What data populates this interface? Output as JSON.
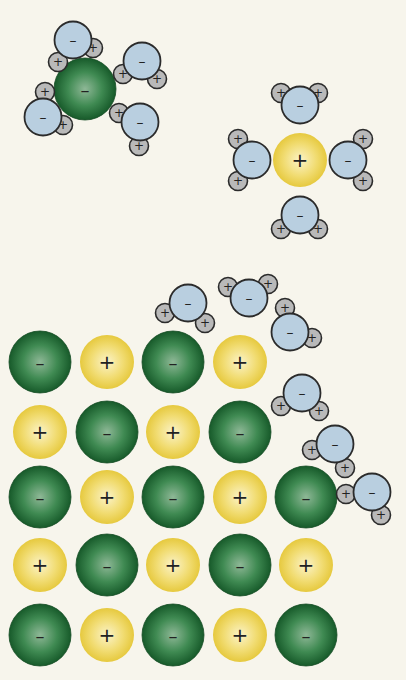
{
  "colors": {
    "background": "#f7f5ec",
    "chloride": "#1f6b35",
    "chloride_light": "#7fae8a",
    "sodium": "#ecd457",
    "sodium_light": "#fbf3c4",
    "oxygen": "#b9cfe0",
    "hydrogen": "#b9b9b9",
    "outline": "#2b2b2b"
  },
  "signs": {
    "positive": "+",
    "negative": "–"
  },
  "lattice": {
    "cols": [
      40,
      107,
      173,
      240,
      306
    ],
    "rows": [
      362,
      432,
      497,
      565,
      635
    ],
    "ions": [
      [
        "Cl",
        "Na",
        "Cl",
        "Na",
        null
      ],
      [
        "Na",
        "Cl",
        "Na",
        "Cl",
        null
      ],
      [
        "Cl",
        "Na",
        "Cl",
        "Na",
        "Cl"
      ],
      [
        "Na",
        "Cl",
        "Na",
        "Cl",
        "Na"
      ],
      [
        "Cl",
        "Na",
        "Cl",
        "Na",
        "Cl"
      ]
    ]
  },
  "free_ions": [
    {
      "type": "Cl",
      "x": 85,
      "y": 89,
      "label": "hydrated chloride ion"
    },
    {
      "type": "Na",
      "x": 300,
      "y": 160,
      "label": "hydrated sodium ion"
    }
  ],
  "water_molecules": [
    {
      "o": [
        73,
        40
      ],
      "h": [
        [
          58,
          62
        ],
        [
          93,
          48
        ]
      ]
    },
    {
      "o": [
        142,
        61
      ],
      "h": [
        [
          123,
          74
        ],
        [
          157,
          79
        ]
      ]
    },
    {
      "o": [
        43,
        117
      ],
      "h": [
        [
          45,
          92
        ],
        [
          63,
          125
        ]
      ]
    },
    {
      "o": [
        140,
        122
      ],
      "h": [
        [
          119,
          113
        ],
        [
          139,
          146
        ]
      ]
    },
    {
      "o": [
        300,
        105
      ],
      "h": [
        [
          281,
          93
        ],
        [
          318,
          93
        ]
      ]
    },
    {
      "o": [
        252,
        160
      ],
      "h": [
        [
          238,
          139
        ],
        [
          238,
          181
        ]
      ]
    },
    {
      "o": [
        348,
        160
      ],
      "h": [
        [
          363,
          139
        ],
        [
          363,
          181
        ]
      ]
    },
    {
      "o": [
        300,
        215
      ],
      "h": [
        [
          281,
          229
        ],
        [
          318,
          229
        ]
      ]
    },
    {
      "o": [
        188,
        303
      ],
      "h": [
        [
          165,
          313
        ],
        [
          205,
          323
        ]
      ]
    },
    {
      "o": [
        249,
        298
      ],
      "h": [
        [
          228,
          287
        ],
        [
          268,
          284
        ]
      ]
    },
    {
      "o": [
        290,
        332
      ],
      "h": [
        [
          285,
          308
        ],
        [
          312,
          338
        ]
      ]
    },
    {
      "o": [
        302,
        393
      ],
      "h": [
        [
          281,
          406
        ],
        [
          319,
          411
        ]
      ]
    },
    {
      "o": [
        335,
        444
      ],
      "h": [
        [
          312,
          450
        ],
        [
          345,
          468
        ]
      ]
    },
    {
      "o": [
        372,
        492
      ],
      "h": [
        [
          346,
          494
        ],
        [
          381,
          515
        ]
      ]
    }
  ]
}
